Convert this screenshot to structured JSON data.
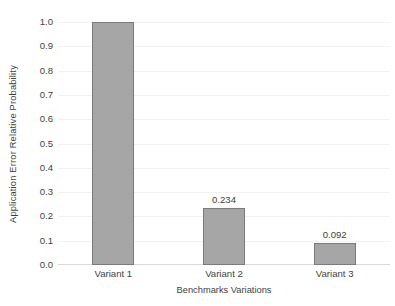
{
  "figure": {
    "clipped_title_fragment": "",
    "background_color": "#ffffff"
  },
  "chart_data": {
    "type": "bar",
    "title": "",
    "categories": [
      "Variant 1",
      "Variant 2",
      "Variant 3"
    ],
    "values": [
      1.0,
      0.234,
      0.092
    ],
    "data_labels": [
      "",
      "0.234",
      "0.092"
    ],
    "xlabel": "Benchmarks Variations",
    "ylabel": "Application Error Relative Probability",
    "ylim": [
      0.0,
      1.0
    ],
    "ytick_labels": [
      "1.0",
      "0.9",
      "0.8",
      "0.7",
      "0.6",
      "0.5",
      "0.4",
      "0.3",
      "0.2",
      "0.1",
      "0.0"
    ],
    "ytick_values": [
      1.0,
      0.9,
      0.8,
      0.7,
      0.6,
      0.5,
      0.4,
      0.3,
      0.2,
      0.1,
      0.0
    ],
    "grid": true,
    "grid_axis": "y",
    "legend": false,
    "legend_position": "none",
    "bar_fill_color": "#a6a6a6",
    "bar_border_color": "#7b7b7b",
    "gridline_color": "#f1f1f1",
    "axis_line_color": "#d9d9d9",
    "text_color": "#3f3f3f"
  }
}
